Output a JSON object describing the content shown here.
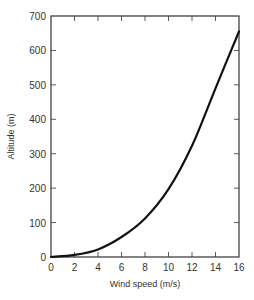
{
  "chart_data": {
    "type": "line",
    "title": "",
    "xlabel": "Wind speed (m/s)",
    "ylabel": "Altitude (m)",
    "xlim": [
      0,
      16
    ],
    "ylim": [
      0,
      700
    ],
    "xticks": [
      0,
      2,
      4,
      6,
      8,
      10,
      12,
      14,
      16
    ],
    "yticks": [
      0,
      100,
      200,
      300,
      400,
      500,
      600,
      700
    ],
    "grid": false,
    "legend": null,
    "series": [
      {
        "name": "Wind profile",
        "color": "#111111",
        "x": [
          0,
          2,
          4,
          6,
          8,
          10,
          12,
          14,
          16
        ],
        "y": [
          0,
          6,
          22,
          58,
          112,
          197,
          323,
          490,
          655
        ]
      }
    ]
  },
  "colors": {
    "axis": "#333333",
    "curve": "#111111",
    "background": "#ffffff"
  }
}
